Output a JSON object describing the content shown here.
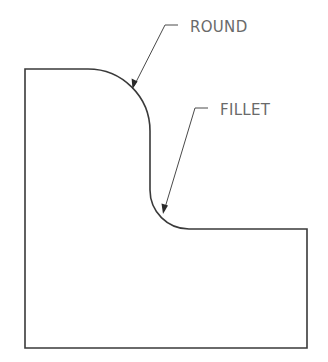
{
  "diagram": {
    "type": "technical-drawing",
    "labels": {
      "round": "ROUND",
      "fillet": "FILLET"
    },
    "colors": {
      "outline": "#3a3a3a",
      "leader": "#4a4a4a",
      "text": "#6a6a6a",
      "background": "#ffffff"
    },
    "annotations": [
      {
        "id": "round",
        "text": "ROUND",
        "points_to": "convex rounded outer corner at top-right of upper block"
      },
      {
        "id": "fillet",
        "text": "FILLET",
        "points_to": "concave inner corner where the step meets the lower block"
      }
    ]
  }
}
